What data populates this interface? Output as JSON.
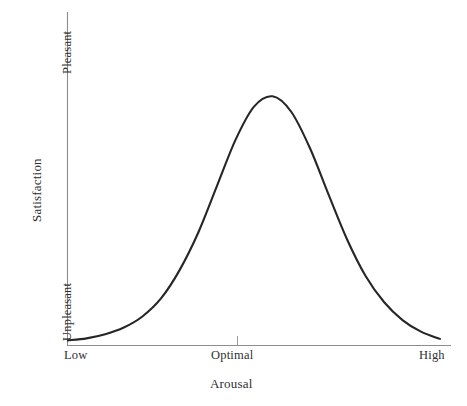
{
  "chart_data": {
    "type": "line",
    "title": "",
    "subtitle": "",
    "xlabel": "Arousal",
    "ylabel": "Satisfaction",
    "x_tick_labels": [
      "Low",
      "Optimal",
      "High"
    ],
    "x_tick_positions": [
      0,
      0.5,
      1
    ],
    "y_tick_labels": [
      "Unpleasant",
      "Pleasant"
    ],
    "y_tick_positions": [
      0,
      1
    ],
    "xlim": [
      0,
      1
    ],
    "ylim": [
      0,
      1
    ],
    "grid": false,
    "legend": "none",
    "annotations": [
      "tick mark at Optimal on x-axis"
    ],
    "series": [
      {
        "name": "Arousal-Satisfaction inverted-U",
        "x": [
          0.0,
          0.05,
          0.1,
          0.15,
          0.2,
          0.25,
          0.3,
          0.35,
          0.4,
          0.45,
          0.5,
          0.55,
          0.6,
          0.65,
          0.7,
          0.75,
          0.8,
          0.85,
          0.9,
          0.95,
          1.0
        ],
        "y": [
          0.012,
          0.02,
          0.036,
          0.062,
          0.105,
          0.175,
          0.285,
          0.43,
          0.61,
          0.79,
          0.92,
          0.96,
          0.9,
          0.76,
          0.58,
          0.405,
          0.262,
          0.16,
          0.09,
          0.045,
          0.018
        ]
      }
    ]
  },
  "axes": {
    "y_top_label": "Pleasant",
    "y_bottom_label": "Unpleasant",
    "y_title": "Satisfaction",
    "x_left_label": "Low",
    "x_mid_label": "Optimal",
    "x_right_label": "High",
    "x_title": "Arousal"
  },
  "style": {
    "curve_color": "#262626",
    "axis_color": "#8d8d8d",
    "text_color": "#2f2f2f",
    "background": "#ffffff"
  }
}
